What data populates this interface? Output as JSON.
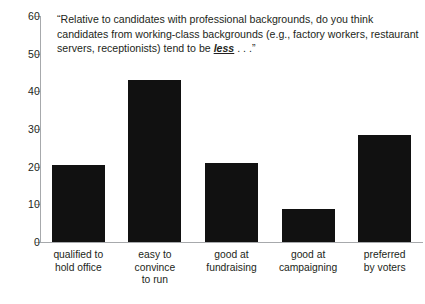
{
  "chart_data": {
    "type": "bar",
    "title_lines": [
      "“Relative to candidates with professional backgrounds, do you think",
      "candidates from working-class backgrounds (e.g., factory workers, restaurant",
      "servers, receptionists) tend to be "
    ],
    "title_emphasis": "less",
    "title_tail": " . . .”",
    "categories": [
      "qualified to hold office",
      "easy to convince to run",
      "good at fundraising",
      "good at campaigning",
      "preferred by voters"
    ],
    "category_lines": [
      [
        "qualified to",
        "hold office"
      ],
      [
        "easy to",
        "convince",
        "to run"
      ],
      [
        "good at",
        "fundraising"
      ],
      [
        "good at",
        "campaigning"
      ],
      [
        "preferred",
        "by voters"
      ]
    ],
    "values": [
      20.5,
      43,
      21,
      8.7,
      28.5
    ],
    "xlabel": "",
    "ylabel": "",
    "ylim": [
      0,
      60
    ],
    "yticks": [
      0,
      10,
      20,
      30,
      40,
      50,
      60
    ],
    "ytick_labels": [
      "0",
      "10",
      "20",
      "30",
      "40",
      "50",
      "60"
    ],
    "grid": false,
    "legend": false,
    "bar_color": "#111111",
    "axis_color": "#a7a9ac",
    "text_color": "#231f20",
    "background": "#ffffff"
  }
}
